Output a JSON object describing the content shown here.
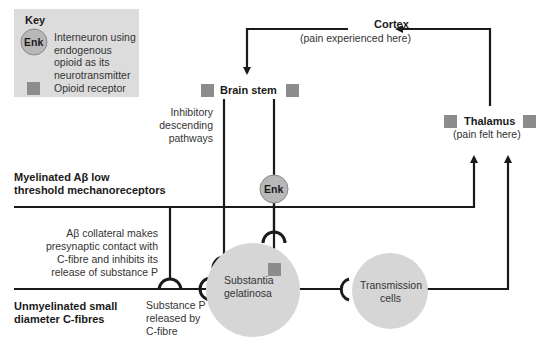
{
  "key": {
    "title": "Key",
    "enk_symbol": "Enk",
    "enk_desc_lines": [
      "Interneuron using",
      "endogenous",
      "opioid as its",
      "neurotransmitter"
    ],
    "receptor_desc": "Opioid receptor"
  },
  "nodes": {
    "cortex": {
      "title": "Cortex",
      "subtitle": "(pain experienced here)"
    },
    "brain_stem": {
      "title": "Brain stem"
    },
    "thalamus": {
      "title": "Thalamus",
      "subtitle": "(pain felt here)"
    },
    "enk": {
      "label": "Enk"
    },
    "substantia": {
      "lines": [
        "Substantia",
        "gelatinosa"
      ]
    },
    "transmission": {
      "lines": [
        "Transmission",
        "cells"
      ]
    }
  },
  "labels": {
    "inhibitory": [
      "Inhibitory",
      "descending",
      "pathways"
    ],
    "myelinated": [
      "Myelinated Aβ low",
      "threshold mechanoreceptors"
    ],
    "collateral": [
      "Aβ collateral makes",
      "presynaptic contact with",
      "C-fibre and inhibits its",
      "release of substance P"
    ],
    "unmyelinated": [
      "Unmyelinated small",
      "diameter C-fibres"
    ],
    "substance_p": [
      "Substance P",
      "released by",
      "C-fibre"
    ]
  },
  "colors": {
    "line": "#1a1a1a",
    "circle": "#d6d6d6",
    "receptor": "#8c8c8c",
    "key_bg": "#dcdcdc",
    "enk_fill": "#b8b8b8"
  }
}
